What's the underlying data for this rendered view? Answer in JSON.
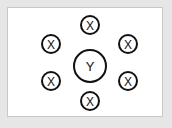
{
  "diagram": {
    "center": {
      "label": "Y",
      "x": 90,
      "y": 66,
      "r": 16
    },
    "satellites": [
      {
        "label": "X",
        "x": 90,
        "y": 25,
        "r": 9
      },
      {
        "label": "X",
        "x": 51,
        "y": 44,
        "r": 9
      },
      {
        "label": "X",
        "x": 128,
        "y": 44,
        "r": 9
      },
      {
        "label": "X",
        "x": 51,
        "y": 81,
        "r": 9
      },
      {
        "label": "X",
        "x": 128,
        "y": 81,
        "r": 9
      },
      {
        "label": "X",
        "x": 90,
        "y": 101,
        "r": 9
      }
    ],
    "colors": {
      "background": "#e6e6e6",
      "panel": "#ffffff",
      "stroke": "#111111"
    }
  }
}
